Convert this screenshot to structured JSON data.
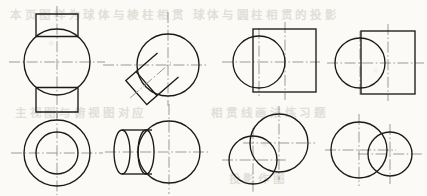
{
  "sheet": {
    "width": 427,
    "height": 196,
    "background_color": "#fbfaf7",
    "line_color": "#1a1a1a",
    "centerline_color": "#8a8a8a",
    "ghost_text_color": "#bdb6aa",
    "title": "Orthographic projection exercises: sphere intersected by prisms and cylinders",
    "rows": 2,
    "columns": 4
  },
  "ghost_text": [
    {
      "text": "本页图样为球体与棱柱相贯",
      "x": 14,
      "y": 6,
      "size": 11
    },
    {
      "text": "球体与圆柱相贯的投影",
      "x": 196,
      "y": 6,
      "size": 11
    },
    {
      "text": "主视图与俯视图对应",
      "x": 18,
      "y": 104,
      "size": 11
    },
    {
      "text": "相贯线画法练习题",
      "x": 214,
      "y": 104,
      "size": 11
    },
    {
      "text": "投影作图",
      "x": 230,
      "y": 170,
      "size": 11
    }
  ],
  "figures": [
    {
      "id": "fig-1-front",
      "name": "sphere-with-top-and-bottom-boss-front-view",
      "row": 1,
      "column": 1,
      "description": "Front view of a sphere with a square prism boss on top and bottom",
      "center": {
        "x": 57,
        "y": 62
      },
      "sphere_radius": 33,
      "boss_half_width": 21,
      "boss_top_y": 14,
      "boss_bottom_y": 110,
      "vertical_centerline": {
        "x": 57,
        "y1": 6,
        "y2": 116
      },
      "horizontal_centerline": {
        "x1": 10,
        "x2": 104,
        "y": 62
      }
    },
    {
      "id": "fig-2-front",
      "name": "sphere-with-inclined-prism-front-view",
      "row": 1,
      "column": 2,
      "description": "Front view of a sphere with an inclined square prism attached at upper left",
      "center": {
        "x": 168,
        "y": 65
      },
      "sphere_radius": 31,
      "prism_angle_deg": -40,
      "prism_half_width": 16,
      "prism_length": 40,
      "vertical_centerline": {
        "x": 168,
        "y1": 12,
        "y2": 104
      },
      "horizontal_centerline": {
        "x1": 104,
        "x2": 206,
        "y": 65
      },
      "inclined_centerline": true
    },
    {
      "id": "fig-3-front",
      "name": "sphere-and-square-prism-overlap-front-view",
      "row": 1,
      "column": 3,
      "description": "Front view: circle overlapping the left portion of a square prism outline",
      "circle_center": {
        "x": 259,
        "y": 62
      },
      "circle_radius": 26,
      "rect": {
        "x": 253,
        "y": 29,
        "width": 63,
        "height": 63
      },
      "vertical_centerline": {
        "x": 285,
        "y": 1
      },
      "horizontal_centerline": {
        "y": 62
      }
    },
    {
      "id": "fig-4-front",
      "name": "sphere-and-rectangular-prism-overlap-front-view",
      "row": 1,
      "column": 4,
      "description": "Front view: circle overlapping the left edge of a vertical rectangular prism",
      "circle_center": {
        "x": 360,
        "y": 63
      },
      "circle_radius": 25,
      "rect": {
        "x": 361,
        "y": 31,
        "width": 54,
        "height": 63
      },
      "vertical_centerline": {
        "x": 388,
        "y": 1
      },
      "horizontal_centerline": {
        "y": 63
      }
    },
    {
      "id": "fig-1-top",
      "name": "sphere-boss-top-view-concentric-circles",
      "row": 2,
      "column": 1,
      "description": "Top view: two concentric circles representing sphere outline and boss",
      "center": {
        "x": 57,
        "y": 153
      },
      "outer_radius": 33,
      "inner_radius": 21,
      "vertical_centerline": {
        "x": 57,
        "y1": 112,
        "y2": 194
      },
      "horizontal_centerline": {
        "x1": 12,
        "x2": 102,
        "y": 153
      }
    },
    {
      "id": "fig-2-top",
      "name": "sphere-with-horizontal-cylinder-side-view",
      "row": 2,
      "column": 2,
      "description": "Side view: sphere with a horizontal cylinder projecting to the left, shown with two ellipses",
      "sphere_center": {
        "x": 169,
        "y": 152
      },
      "sphere_radius": 31,
      "ellipse_near": {
        "cx": 146,
        "cy": 152,
        "rx": 8,
        "ry": 22
      },
      "ellipse_far": {
        "cx": 122,
        "cy": 152,
        "rx": 8,
        "ry": 22
      },
      "vertical_centerline": {
        "x": 169,
        "y1": 104,
        "y2": 192
      },
      "horizontal_centerline": {
        "x1": 106,
        "x2": 208,
        "y": 152
      }
    },
    {
      "id": "fig-3-top",
      "name": "two-offset-intersecting-circles-diagonal",
      "row": 2,
      "column": 3,
      "description": "Two intersecting circles offset diagonally: larger upper-right, smaller lower-left",
      "circle_large": {
        "cx": 279,
        "cy": 143,
        "r": 29
      },
      "circle_small": {
        "cx": 253,
        "cy": 160,
        "r": 24
      },
      "vertical_centerlines": [
        279,
        253
      ],
      "horizontal_centerlines": [
        143,
        160
      ]
    },
    {
      "id": "fig-4-top",
      "name": "two-intersecting-circles-horizontal",
      "row": 2,
      "column": 4,
      "description": "Two intersecting circles side by side: larger left, smaller right",
      "circle_large": {
        "cx": 359,
        "cy": 150,
        "r": 28
      },
      "circle_small": {
        "cx": 390,
        "cy": 154,
        "r": 22
      },
      "vertical_centerlines": [
        359,
        390
      ],
      "horizontal_centerlines": [
        150,
        154
      ]
    }
  ]
}
